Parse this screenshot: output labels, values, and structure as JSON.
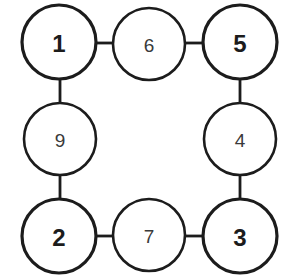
{
  "diagram": {
    "type": "node-link-ring",
    "background_color": "#ffffff",
    "stroke_color": "#1c1c1c",
    "fill_color": "#ffffff",
    "label_color": "#1c1c1c",
    "nodes": [
      {
        "id": "node-1",
        "label": "1",
        "position": "top-left",
        "cx": 59,
        "cy": 42,
        "r": 37,
        "stroke_width": 3.2,
        "emphasis": "bold",
        "font_size": 24
      },
      {
        "id": "node-6",
        "label": "6",
        "position": "top-center",
        "cx": 149,
        "cy": 44,
        "r": 36,
        "stroke_width": 2.6,
        "emphasis": "light",
        "font_size": 19
      },
      {
        "id": "node-5",
        "label": "5",
        "position": "top-right",
        "cx": 240,
        "cy": 42,
        "r": 37,
        "stroke_width": 3.2,
        "emphasis": "bold",
        "font_size": 24
      },
      {
        "id": "node-9",
        "label": "9",
        "position": "left-center",
        "cx": 60,
        "cy": 139,
        "r": 36,
        "stroke_width": 2.6,
        "emphasis": "light",
        "font_size": 19
      },
      {
        "id": "node-4",
        "label": "4",
        "position": "right-center",
        "cx": 240,
        "cy": 139,
        "r": 36,
        "stroke_width": 2.6,
        "emphasis": "light",
        "font_size": 19
      },
      {
        "id": "node-2",
        "label": "2",
        "position": "bottom-left",
        "cx": 59,
        "cy": 236,
        "r": 37,
        "stroke_width": 3.2,
        "emphasis": "bold",
        "font_size": 24
      },
      {
        "id": "node-7",
        "label": "7",
        "position": "bottom-center",
        "cx": 149,
        "cy": 235,
        "r": 36,
        "stroke_width": 2.6,
        "emphasis": "light",
        "font_size": 19
      },
      {
        "id": "node-3",
        "label": "3",
        "position": "bottom-right",
        "cx": 240,
        "cy": 236,
        "r": 37,
        "stroke_width": 3.2,
        "emphasis": "bold",
        "font_size": 24
      }
    ],
    "edges": [
      {
        "id": "edge-1-6",
        "from": "1",
        "to": "6",
        "orientation": "horizontal",
        "x1": 96,
        "y1": 43,
        "x2": 113,
        "y2": 43,
        "stroke_width": 2.8
      },
      {
        "id": "edge-6-5",
        "from": "6",
        "to": "5",
        "orientation": "horizontal",
        "x1": 185,
        "y1": 43,
        "x2": 203,
        "y2": 43,
        "stroke_width": 2.8
      },
      {
        "id": "edge-1-9",
        "from": "1",
        "to": "9",
        "orientation": "vertical",
        "x1": 60,
        "y1": 79,
        "x2": 60,
        "y2": 103,
        "stroke_width": 2.8
      },
      {
        "id": "edge-5-4",
        "from": "5",
        "to": "4",
        "orientation": "vertical",
        "x1": 240,
        "y1": 79,
        "x2": 240,
        "y2": 103,
        "stroke_width": 2.8
      },
      {
        "id": "edge-9-2",
        "from": "9",
        "to": "2",
        "orientation": "vertical",
        "x1": 60,
        "y1": 175,
        "x2": 60,
        "y2": 199,
        "stroke_width": 2.8
      },
      {
        "id": "edge-4-3",
        "from": "4",
        "to": "3",
        "orientation": "vertical",
        "x1": 240,
        "y1": 175,
        "x2": 240,
        "y2": 199,
        "stroke_width": 2.8
      },
      {
        "id": "edge-2-7",
        "from": "2",
        "to": "7",
        "orientation": "horizontal",
        "x1": 96,
        "y1": 236,
        "x2": 113,
        "y2": 236,
        "stroke_width": 2.8
      },
      {
        "id": "edge-7-3",
        "from": "7",
        "to": "3",
        "orientation": "horizontal",
        "x1": 185,
        "y1": 236,
        "x2": 203,
        "y2": 236,
        "stroke_width": 2.8
      }
    ]
  }
}
